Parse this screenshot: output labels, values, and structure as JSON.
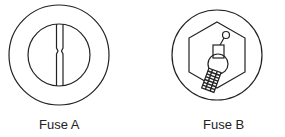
{
  "figures": [
    {
      "id": "fuse-a",
      "label": "Fuse A",
      "description": "round ceramic fuse with flat strip element narrowed at center"
    },
    {
      "id": "fuse-b",
      "label": "Fuse B",
      "description": "fuse with hexagonal body and wire element with coiled spring"
    }
  ],
  "colors": {
    "stroke": "#222222",
    "background": "#ffffff"
  }
}
